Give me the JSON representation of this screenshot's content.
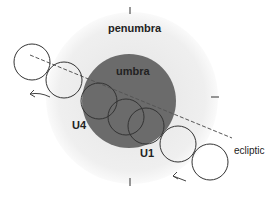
{
  "diagram": {
    "labels": {
      "penumbra": "penumbra",
      "umbra": "umbra",
      "u4": "U4",
      "u1": "U1",
      "ecliptic": "ecliptic"
    },
    "colors": {
      "penumbra": "#f2f2f2",
      "umbra": "#6b6b6b",
      "moon_outline": "#333333",
      "ecliptic_line": "#555555"
    },
    "moon_positions": 6
  }
}
